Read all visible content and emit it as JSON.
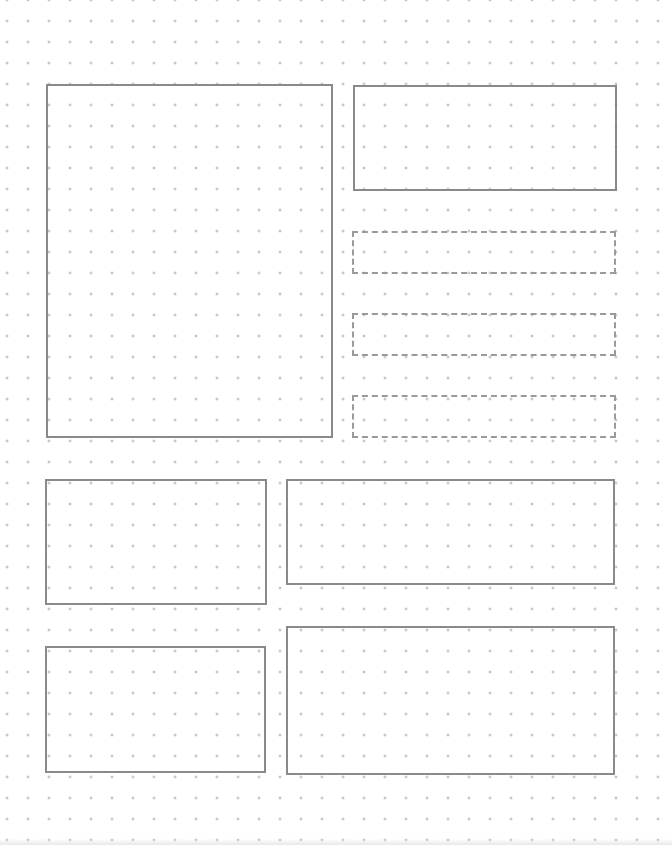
{
  "page": {
    "type": "dot-grid layout sketch",
    "background": "#ffffff",
    "dot_color": "#b8b8b8",
    "line_color": "#8a8a8a",
    "dot_spacing_px": 21
  },
  "boxes": [
    {
      "id": "large-panel-left",
      "style": "solid"
    },
    {
      "id": "panel-top-right",
      "style": "solid"
    },
    {
      "id": "placeholder-1",
      "style": "dashed"
    },
    {
      "id": "placeholder-2",
      "style": "dashed"
    },
    {
      "id": "placeholder-3",
      "style": "dashed"
    },
    {
      "id": "panel-mid-left",
      "style": "solid"
    },
    {
      "id": "panel-mid-right",
      "style": "solid"
    },
    {
      "id": "panel-bottom-left",
      "style": "solid"
    },
    {
      "id": "panel-bottom-right",
      "style": "solid"
    }
  ]
}
